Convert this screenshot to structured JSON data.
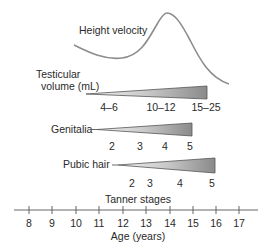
{
  "diagram": {
    "curve_label": "Height velocity",
    "testicular": {
      "label_line1": "Testicular",
      "label_line2": "volume (mL)",
      "values": [
        "4–6",
        "10–12",
        "15–25"
      ]
    },
    "genitalia": {
      "label": "Genitalia",
      "stages": [
        "2",
        "3",
        "4",
        "5"
      ]
    },
    "pubic_hair": {
      "label": "Pubic hair",
      "stages": [
        "2",
        "3",
        "4",
        "5"
      ]
    },
    "tanner_label": "Tanner stages",
    "axis": {
      "title": "Age (years)",
      "ticks": [
        "8",
        "9",
        "10",
        "11",
        "12",
        "13",
        "14",
        "15",
        "16",
        "17"
      ]
    },
    "colors": {
      "curve": "#8c8c8c",
      "triangle_light": "#f2f2f2",
      "triangle_dark": "#8f8f8f",
      "axis": "#555555",
      "text": "#2a2a2a"
    }
  }
}
